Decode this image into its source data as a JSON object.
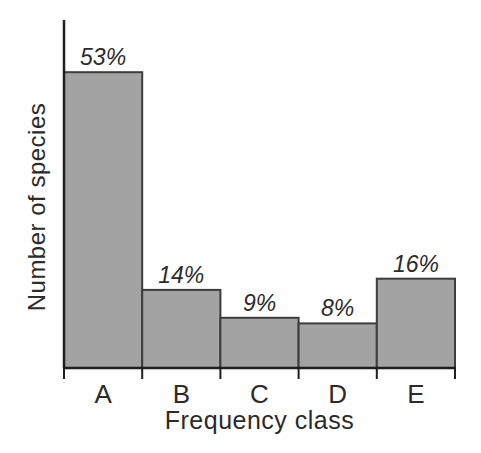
{
  "chart_data": {
    "type": "bar",
    "categories": [
      "A",
      "B",
      "C",
      "D",
      "E"
    ],
    "values": [
      53,
      14,
      9,
      8,
      16
    ],
    "bar_labels": [
      "53%",
      "14%",
      "9%",
      "8%",
      "16%"
    ],
    "title": "",
    "xlabel": "Frequency class",
    "ylabel": "Number of species",
    "ylim": [
      0,
      62
    ],
    "y_tick_labels": "none",
    "grid": false,
    "legend": "none",
    "colors": {
      "bar_fill": "#a3a3a3",
      "bar_stroke": "#3d3d3d",
      "axis": "#1f1f1f",
      "text": "#2b2b2b",
      "background": "#fefefe"
    }
  }
}
